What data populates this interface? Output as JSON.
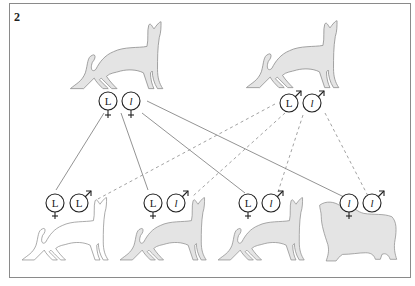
{
  "figure": {
    "number": "2"
  },
  "colors": {
    "cat_fill": "#e4e4e4",
    "cat_fill_white": "#ffffff",
    "cat_stroke": "#8c8c8c",
    "line_solid": "#777777",
    "line_dashed": "#8a8a8a",
    "symbol_stroke": "#222222",
    "border": "#8a8a8a"
  },
  "parents": [
    {
      "role": "mother",
      "sex": "female",
      "sex_symbol": "♀",
      "alleles": [
        "L",
        "l"
      ],
      "phenotype": "short hair",
      "filled": true
    },
    {
      "role": "father",
      "sex": "male",
      "sex_symbol": "♂",
      "alleles": [
        "L",
        "l"
      ],
      "phenotype": "short hair",
      "filled": true
    }
  ],
  "offspring": [
    {
      "maternal_allele": "L",
      "paternal_allele": "L",
      "phenotype": "short hair",
      "filled": false
    },
    {
      "maternal_allele": "L",
      "paternal_allele": "l",
      "phenotype": "short hair",
      "filled": true
    },
    {
      "maternal_allele": "L",
      "paternal_allele": "l",
      "phenotype": "short hair",
      "filled": true
    },
    {
      "maternal_allele": "l",
      "paternal_allele": "l",
      "phenotype": "long hair",
      "filled": true
    }
  ],
  "legend": {
    "solid_line": "maternal allele inheritance",
    "dashed_line": "paternal allele inheritance"
  }
}
